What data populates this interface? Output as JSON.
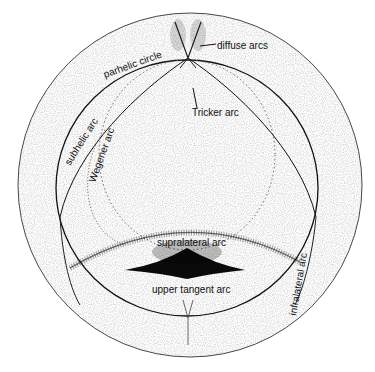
{
  "diagram": {
    "type": "halo-simulation",
    "labels": {
      "diffuse_arcs": "diffuse arcs",
      "parhelic_circle": "parhelic circle",
      "tricker_arc": "Tricker arc",
      "subhelic_arc": "subhelic arc",
      "wegener_arc": "Wegener arc",
      "supralateral_arc": "supralateral arc",
      "upper_tangent_arc": "upper tangent arc",
      "infralateral_arc": "infralateral arc"
    },
    "colors": {
      "background": "#ffffff",
      "ink": "#111111",
      "speckle": "#555555"
    }
  }
}
